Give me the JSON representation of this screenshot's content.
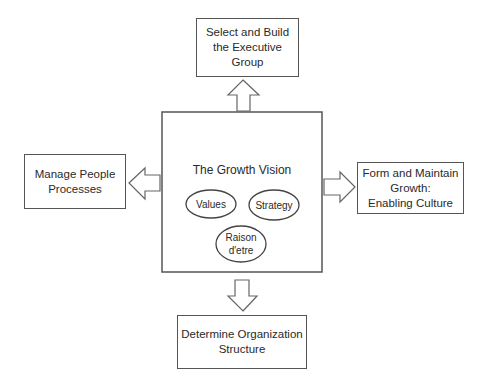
{
  "diagram": {
    "center": {
      "title": "The Growth Vision",
      "ellipses": [
        {
          "label": "Values"
        },
        {
          "label": "Strategy"
        },
        {
          "label": "Raison\nd'etre"
        }
      ]
    },
    "top_box": {
      "label": "Select and Build\nthe Executive Group"
    },
    "left_box": {
      "label": "Manage People\nProcesses"
    },
    "right_box": {
      "label": "Form and Maintain\nGrowth:\nEnabling Culture"
    },
    "bottom_box": {
      "label": "Determine Organization\nStructure"
    },
    "arrows": [
      "up",
      "left",
      "right",
      "down"
    ],
    "colors": {
      "stroke": "#555555",
      "text": "#2a2a2a",
      "background": "#ffffff"
    }
  }
}
